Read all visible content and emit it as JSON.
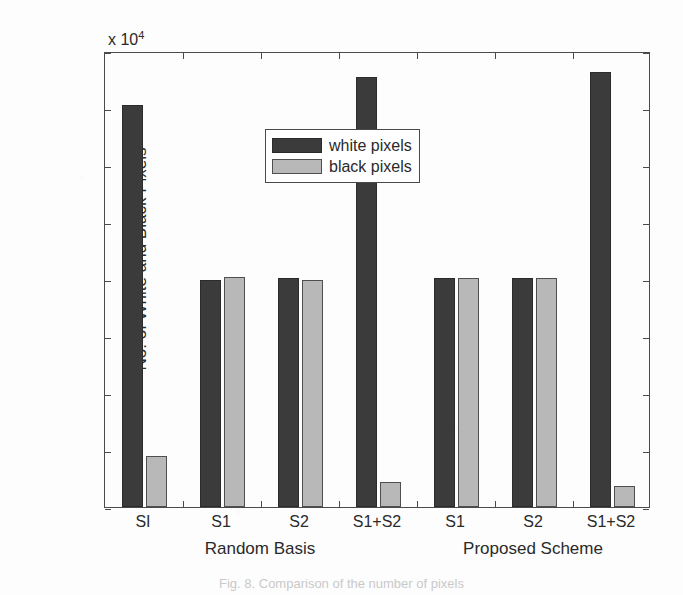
{
  "figure": {
    "caption": "Fig. 8.  Comparison of the number of pixels",
    "background_color": "#fdfdfd"
  },
  "chart_data": {
    "type": "bar",
    "title": "",
    "subtitle": "",
    "xlabel": "",
    "ylabel": "No. of  White and Black Pixels",
    "y_exponent_label": "x 10",
    "y_exponent_power": "4",
    "y_multiplier": 10000,
    "ylim": [
      0,
      4
    ],
    "yticks": [
      0,
      0.5,
      1,
      1.5,
      2,
      2.5,
      3,
      3.5,
      4
    ],
    "ytick_labels": [
      "0",
      "0.5",
      "1",
      "1.5",
      "2",
      "2.5",
      "3",
      "3.5",
      "4"
    ],
    "grid": false,
    "legend_position": "upper left inside",
    "categories": [
      "SI",
      "S1",
      "S2",
      "S1+S2",
      "S1",
      "S2",
      "S1+S2"
    ],
    "group_labels": [
      "Random Basis",
      "Proposed Scheme"
    ],
    "groups": [
      {
        "label": "Random Basis",
        "categories": [
          "SI",
          "S1",
          "S2",
          "S1+S2"
        ]
      },
      {
        "label": "Proposed Scheme",
        "categories": [
          "S1",
          "S2",
          "S1+S2"
        ]
      }
    ],
    "series": [
      {
        "name": "white pixels",
        "color": "#3b3b3b",
        "values": [
          3.53,
          1.99,
          2.01,
          3.77,
          2.01,
          2.01,
          3.82
        ]
      },
      {
        "name": "black pixels",
        "color": "#b8b8b8",
        "values": [
          0.45,
          2.02,
          1.99,
          0.22,
          2.01,
          2.01,
          0.18
        ]
      }
    ],
    "legend": [
      {
        "label": "white pixels",
        "color": "#3b3b3b"
      },
      {
        "label": "black pixels",
        "color": "#b8b8b8"
      }
    ]
  },
  "colors": {
    "axis": "#4a4a4a",
    "text": "#2a2a2a",
    "white_pixels": "#3b3b3b",
    "black_pixels": "#b8b8b8"
  }
}
